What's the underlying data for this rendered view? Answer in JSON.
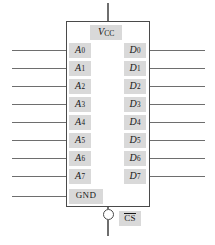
{
  "diagram": {
    "component_type": "memory-ic",
    "colors": {
      "line": "#4a4a4a",
      "wire": "#6e6e6e",
      "label_background": "#d9d9d9",
      "text": "#171717",
      "page_background": "#ffffff"
    },
    "body": {
      "x": 66,
      "y": 21,
      "width": 84,
      "height": 186
    },
    "supply": {
      "label_text": "V",
      "label_subscript": "CC",
      "name": "vcc",
      "wire": {
        "x": 108,
        "y_top": 3,
        "y_bottom": 21
      },
      "label_box": {
        "x": 90,
        "y": 25,
        "width": 32,
        "height": 15
      }
    },
    "chip_select": {
      "label_text": "CS",
      "active_low": true,
      "bubble": {
        "cx": 108,
        "cy": 214.5,
        "r": 5.5
      },
      "wire": {
        "x": 108,
        "y_top": 220,
        "y_bottom": 236
      },
      "label_box": {
        "x": 119,
        "y": 211,
        "width": 22,
        "height": 15
      }
    },
    "left_pins": [
      {
        "name": "A0",
        "text": "A",
        "sub": "0",
        "y": 50,
        "wire_x_start": 12,
        "label_x": 69,
        "label_w": 22
      },
      {
        "name": "A1",
        "text": "A",
        "sub": "1",
        "y": 68,
        "wire_x_start": 12,
        "label_x": 69,
        "label_w": 22
      },
      {
        "name": "A2",
        "text": "A",
        "sub": "2",
        "y": 86,
        "wire_x_start": 12,
        "label_x": 69,
        "label_w": 22
      },
      {
        "name": "A3",
        "text": "A",
        "sub": "3",
        "y": 104,
        "wire_x_start": 12,
        "label_x": 69,
        "label_w": 22
      },
      {
        "name": "A4",
        "text": "A",
        "sub": "4",
        "y": 122,
        "wire_x_start": 12,
        "label_x": 69,
        "label_w": 22
      },
      {
        "name": "A5",
        "text": "A",
        "sub": "5",
        "y": 140,
        "wire_x_start": 12,
        "label_x": 69,
        "label_w": 22
      },
      {
        "name": "A6",
        "text": "A",
        "sub": "6",
        "y": 158,
        "wire_x_start": 12,
        "label_x": 69,
        "label_w": 22
      },
      {
        "name": "A7",
        "text": "A",
        "sub": "7",
        "y": 176,
        "wire_x_start": 12,
        "label_x": 69,
        "label_w": 22
      }
    ],
    "ground_pin": {
      "name": "GND",
      "text": "GND",
      "y": 196,
      "wire_x_start": 12,
      "label_x": 69,
      "label_w": 34
    },
    "right_pins": [
      {
        "name": "D0",
        "text": "D",
        "sub": "0",
        "y": 50,
        "wire_x_end": 205,
        "label_x": 124,
        "label_w": 22
      },
      {
        "name": "D1",
        "text": "D",
        "sub": "1",
        "y": 68,
        "wire_x_end": 205,
        "label_x": 124,
        "label_w": 22
      },
      {
        "name": "D2",
        "text": "D",
        "sub": "2",
        "y": 86,
        "wire_x_end": 205,
        "label_x": 124,
        "label_w": 22
      },
      {
        "name": "D3",
        "text": "D",
        "sub": "3",
        "y": 104,
        "wire_x_end": 205,
        "label_x": 124,
        "label_w": 22
      },
      {
        "name": "D4",
        "text": "D",
        "sub": "4",
        "y": 122,
        "wire_x_end": 205,
        "label_x": 124,
        "label_w": 22
      },
      {
        "name": "D5",
        "text": "D",
        "sub": "5",
        "y": 140,
        "wire_x_end": 205,
        "label_x": 124,
        "label_w": 22
      },
      {
        "name": "D6",
        "text": "D",
        "sub": "6",
        "y": 158,
        "wire_x_end": 205,
        "label_x": 124,
        "label_w": 22
      },
      {
        "name": "D7",
        "text": "D",
        "sub": "7",
        "y": 176,
        "wire_x_end": 205,
        "label_x": 124,
        "label_w": 22
      }
    ]
  }
}
